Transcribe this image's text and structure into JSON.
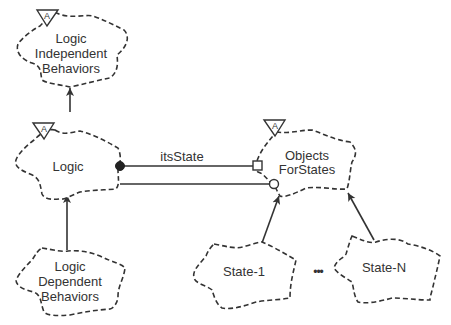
{
  "diagram": {
    "type": "class-category-diagram",
    "nodes": [
      {
        "id": "logic_independent",
        "lines": [
          "Logic",
          "Independent",
          "Behaviors"
        ],
        "abstract_marker": "A"
      },
      {
        "id": "logic",
        "lines": [
          "Logic"
        ],
        "abstract_marker": "A"
      },
      {
        "id": "logic_dependent",
        "lines": [
          "Logic",
          "Dependent",
          "Behaviors"
        ]
      },
      {
        "id": "objects_for_states",
        "lines": [
          "Objects",
          "ForStates"
        ],
        "abstract_marker": "A"
      },
      {
        "id": "state_1",
        "lines": [
          "State-1"
        ]
      },
      {
        "id": "state_n",
        "lines": [
          "State-N"
        ]
      }
    ],
    "ellipsis": "•••",
    "edges": [
      {
        "from": "logic",
        "to": "logic_independent",
        "type": "inheritance-arrow"
      },
      {
        "from": "logic_dependent",
        "to": "logic",
        "type": "inheritance-arrow"
      },
      {
        "from": "logic",
        "to": "objects_for_states",
        "type": "association",
        "label": "itsState",
        "source_adornment": "filled-circle",
        "target_adornment": "square"
      },
      {
        "from": "logic",
        "to": "objects_for_states",
        "type": "association",
        "target_adornment": "open-circle"
      },
      {
        "from": "state_1",
        "to": "objects_for_states",
        "type": "inheritance-arrow"
      },
      {
        "from": "state_n",
        "to": "objects_for_states",
        "type": "inheritance-arrow"
      }
    ]
  }
}
